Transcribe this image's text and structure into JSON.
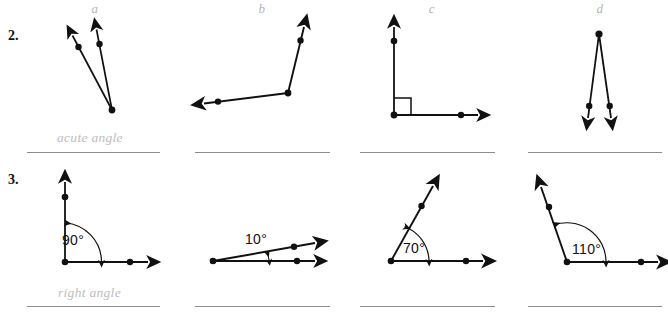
{
  "worksheet": {
    "columns": [
      {
        "label": "a",
        "x": 95
      },
      {
        "label": "b",
        "x": 262
      },
      {
        "label": "c",
        "x": 432
      },
      {
        "label": "d",
        "x": 600
      }
    ],
    "rows": [
      {
        "number": "2.",
        "sample_answer": "acute angle",
        "items": [
          {
            "column": "a",
            "type": "angle-figure",
            "angle_label": "",
            "orientation": "two-rays-up-from-bottom-vertex"
          },
          {
            "column": "b",
            "type": "angle-figure",
            "angle_label": "",
            "orientation": "ray-left-and-ray-up-right"
          },
          {
            "column": "c",
            "type": "angle-figure",
            "angle_label": "",
            "orientation": "right-angle-with-square-marker"
          },
          {
            "column": "d",
            "type": "angle-figure",
            "angle_label": "",
            "orientation": "two-rays-down-from-top-vertex"
          }
        ]
      },
      {
        "number": "3.",
        "sample_answer": "right angle",
        "items": [
          {
            "column": "a",
            "type": "measured-angle",
            "angle_label": "90°",
            "orientation": "vertical-and-horizontal-rays"
          },
          {
            "column": "b",
            "type": "measured-angle",
            "angle_label": "10°",
            "orientation": "horizontal-and-slightly-inclined-rays"
          },
          {
            "column": "c",
            "type": "measured-angle",
            "angle_label": "70°",
            "orientation": "horizontal-and-up-right-ray"
          },
          {
            "column": "d",
            "type": "measured-angle",
            "angle_label": "110°",
            "orientation": "horizontal-and-up-left-ray"
          }
        ]
      }
    ],
    "colors": {
      "ink": "#111111",
      "answer_line": "#8d8d8d",
      "sample_answer_text": "#bdbdbd",
      "column_letter": "#b3b3b3",
      "background": "#ffffff"
    }
  }
}
